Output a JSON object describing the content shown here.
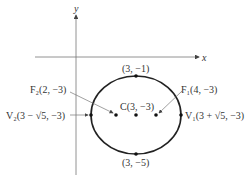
{
  "diagram": {
    "type": "ellipse-graph",
    "axes": {
      "x_label": "x",
      "y_label": "y"
    },
    "ellipse": {
      "center": [
        3,
        -3
      ],
      "a": "√5",
      "b": 2,
      "major_axis": "horizontal"
    },
    "points": {
      "top": {
        "label": "(3, −1)"
      },
      "bottom": {
        "label": "(3, −5)"
      },
      "center": {
        "name": "C",
        "label": "C(3, −3)"
      },
      "focus1": {
        "name": "F1",
        "label": "F₁(4, −3)"
      },
      "focus2": {
        "name": "F2",
        "label": "F₂(2, −3)"
      },
      "vertex1": {
        "name": "V1",
        "label": "V₁(3 + √5, −3)"
      },
      "vertex2": {
        "name": "V2",
        "label": "V₂(3 − √5, −3)"
      }
    }
  },
  "colors": {
    "stroke": "#222222",
    "axis": "#777777",
    "text": "#333333"
  }
}
